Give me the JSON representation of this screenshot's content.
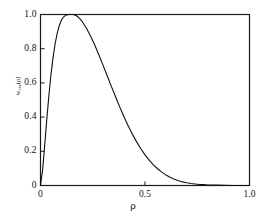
{
  "figure": {
    "background_color": "#ffffff",
    "axis_color": "#1a1a1a",
    "curve_color": "#111111"
  },
  "axes": {
    "x": {
      "label": "ρ",
      "ticks": [
        "0",
        "0.5",
        "1.0"
      ],
      "tick_values": [
        0,
        0.5,
        1.0
      ],
      "range": [
        0,
        1.0
      ]
    },
    "y": {
      "label_prefix": "w",
      "label_sub": "cav",
      "label_suffix": "(ρ)",
      "label": "w",
      "ticks": [
        "0",
        "0.2",
        "0.4",
        "0.6",
        "0.8",
        "1.0"
      ],
      "tick_values": [
        0,
        0.2,
        0.4,
        0.6,
        0.8,
        1.0
      ],
      "range": [
        0,
        1.0
      ]
    }
  },
  "chart_data": {
    "type": "line",
    "title": "",
    "xlabel": "ρ",
    "ylabel": "w_cav(ρ)",
    "xlim": [
      0,
      1.0
    ],
    "ylim": [
      0,
      1.0
    ],
    "grid": false,
    "legend": null,
    "xticks": [
      0,
      0.5,
      1.0
    ],
    "xticklabels": [
      "0",
      "0.5",
      "1.0"
    ],
    "yticks": [
      0,
      0.2,
      0.4,
      0.6,
      0.8,
      1.0
    ],
    "yticklabels": [
      "0",
      "0.2",
      "0.4",
      "0.6",
      "0.8",
      "1.0"
    ],
    "peak": {
      "x": 0.155,
      "y": 1.0
    },
    "series": [
      {
        "name": "w_cav(ρ)",
        "color": "#111111",
        "linewidth": 1.1,
        "x": [
          0.0,
          0.01,
          0.02,
          0.03,
          0.04,
          0.05,
          0.06,
          0.07,
          0.08,
          0.09,
          0.1,
          0.11,
          0.12,
          0.13,
          0.14,
          0.15,
          0.155,
          0.16,
          0.17,
          0.18,
          0.19,
          0.2,
          0.22,
          0.24,
          0.26,
          0.28,
          0.3,
          0.32,
          0.34,
          0.36,
          0.38,
          0.4,
          0.42,
          0.44,
          0.46,
          0.48,
          0.5,
          0.52,
          0.54,
          0.56,
          0.58,
          0.6,
          0.62,
          0.64,
          0.66,
          0.68,
          0.7,
          0.72,
          0.74,
          0.76,
          0.78,
          0.8,
          0.84,
          0.88,
          0.92,
          0.96,
          1.0
        ],
        "y": [
          0.0,
          0.09,
          0.234,
          0.385,
          0.525,
          0.647,
          0.748,
          0.829,
          0.891,
          0.936,
          0.966,
          0.985,
          0.995,
          0.999,
          1.0,
          1.0,
          1.0,
          0.999,
          0.994,
          0.985,
          0.973,
          0.958,
          0.92,
          0.873,
          0.82,
          0.762,
          0.701,
          0.639,
          0.577,
          0.516,
          0.457,
          0.401,
          0.348,
          0.299,
          0.255,
          0.215,
          0.179,
          0.148,
          0.121,
          0.098,
          0.078,
          0.062,
          0.048,
          0.037,
          0.028,
          0.021,
          0.016,
          0.012,
          0.009,
          0.006,
          0.005,
          0.003,
          0.002,
          0.001,
          0.0,
          0.0,
          0.0
        ]
      }
    ]
  }
}
